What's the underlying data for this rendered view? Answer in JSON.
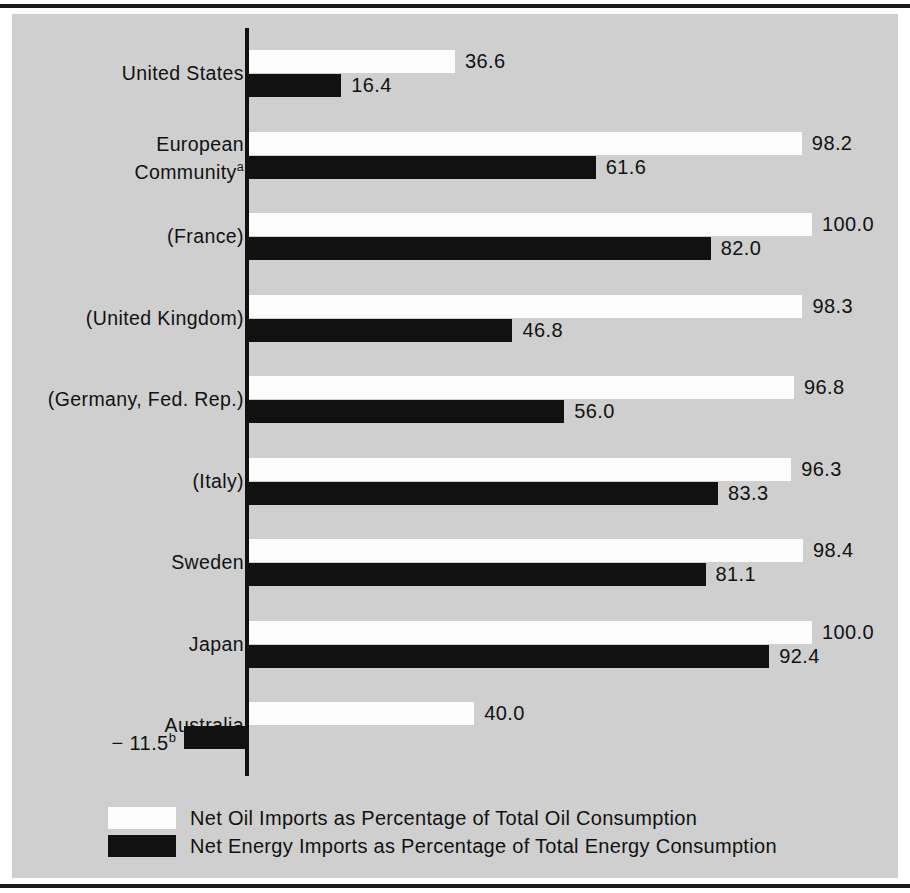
{
  "chart_data": {
    "type": "bar",
    "orientation": "horizontal",
    "title": "",
    "xlabel": "",
    "ylabel": "",
    "xlim": [
      -20,
      110
    ],
    "grid": false,
    "legend_position": "bottom-left",
    "categories": [
      "United States",
      "European Community",
      "(France)",
      "(United Kingdom)",
      "(Germany, Fed. Rep.)",
      "(Italy)",
      "Sweden",
      "Japan",
      "Australia"
    ],
    "series": [
      {
        "name": "Net Oil Imports as Percentage of Total Oil Consumption",
        "color": "#fdfdfd",
        "values": [
          36.6,
          98.2,
          100.0,
          98.3,
          96.8,
          96.3,
          98.4,
          100.0,
          40.0
        ],
        "labels": [
          "36.6",
          "98.2",
          "100.0",
          "98.3",
          "96.8",
          "96.3",
          "98.4",
          "100.0",
          "40.0"
        ]
      },
      {
        "name": "Net Energy Imports as Percentage of Total Energy Consumption",
        "color": "#111111",
        "values": [
          16.4,
          61.6,
          82.0,
          46.8,
          56.0,
          83.3,
          81.1,
          92.4,
          -11.5
        ],
        "labels": [
          "16.4",
          "61.6",
          "82.0",
          "46.8",
          "56.0",
          "83.3",
          "81.1",
          "92.4",
          "− 11.5"
        ]
      }
    ],
    "footnote_markers": {
      "european_community": "a",
      "australia_energy": "b"
    }
  },
  "rows": [
    {
      "name": "united-states",
      "label": "United States",
      "marker": "",
      "oil_value": "36.6",
      "energy_value": "16.4",
      "energy_marker": ""
    },
    {
      "name": "european-community",
      "label": "European\nCommunity",
      "marker": "a",
      "oil_value": "98.2",
      "energy_value": "61.6",
      "energy_marker": ""
    },
    {
      "name": "france",
      "label": "(France)",
      "marker": "",
      "oil_value": "100.0",
      "energy_value": "82.0",
      "energy_marker": ""
    },
    {
      "name": "united-kingdom",
      "label": "(United Kingdom)",
      "marker": "",
      "oil_value": "98.3",
      "energy_value": "46.8",
      "energy_marker": ""
    },
    {
      "name": "germany-fed-rep",
      "label": "(Germany, Fed. Rep.)",
      "marker": "",
      "oil_value": "96.8",
      "energy_value": "56.0",
      "energy_marker": ""
    },
    {
      "name": "italy",
      "label": "(Italy)",
      "marker": "",
      "oil_value": "96.3",
      "energy_value": "83.3",
      "energy_marker": ""
    },
    {
      "name": "sweden",
      "label": "Sweden",
      "marker": "",
      "oil_value": "98.4",
      "energy_value": "81.1",
      "energy_marker": ""
    },
    {
      "name": "japan",
      "label": "Japan",
      "marker": "",
      "oil_value": "100.0",
      "energy_value": "92.4",
      "energy_marker": ""
    },
    {
      "name": "australia",
      "label": "Australia",
      "marker": "",
      "oil_value": "40.0",
      "energy_value": "− 11.5",
      "energy_marker": "b"
    }
  ],
  "legend": {
    "oil_label": "Net Oil Imports as Percentage of Total Oil Consumption",
    "energy_label": "Net Energy Imports as Percentage of Total Energy Consumption"
  },
  "colors": {
    "panel_background": "#cfcfcf",
    "page_background": "#ffffff",
    "oil_bar": "#fdfdfd",
    "energy_bar": "#111111",
    "text": "#111111",
    "rule": "#1a1a1a"
  }
}
